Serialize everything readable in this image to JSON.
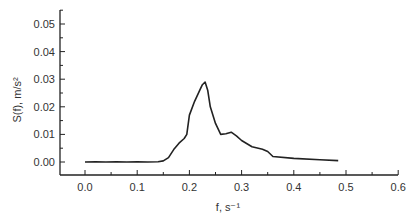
{
  "chart_data": {
    "type": "line",
    "title": "",
    "xlabel": "f, s⁻¹",
    "ylabel": "S(f), m/s²",
    "xlim": [
      -0.05,
      0.6
    ],
    "ylim": [
      -0.005,
      0.055
    ],
    "x_ticks": [
      "0.0",
      "0.1",
      "0.2",
      "0.3",
      "0.4",
      "0.5",
      "0.6"
    ],
    "y_ticks": [
      "0.00",
      "0.01",
      "0.02",
      "0.03",
      "0.04",
      "0.05"
    ],
    "grid": false,
    "legend": null,
    "series": [
      {
        "name": "S(f)",
        "color": "#222222",
        "x": [
          0.0,
          0.02,
          0.04,
          0.06,
          0.08,
          0.1,
          0.12,
          0.14,
          0.15,
          0.16,
          0.17,
          0.18,
          0.19,
          0.195,
          0.2,
          0.21,
          0.22,
          0.225,
          0.23,
          0.235,
          0.24,
          0.25,
          0.26,
          0.27,
          0.28,
          0.29,
          0.3,
          0.32,
          0.34,
          0.35,
          0.36,
          0.4,
          0.45,
          0.485
        ],
        "y": [
          0.0,
          0.0001,
          0.0,
          0.0001,
          0.0,
          0.0001,
          0.0,
          0.0001,
          0.0004,
          0.0016,
          0.0045,
          0.0068,
          0.0085,
          0.01,
          0.017,
          0.022,
          0.026,
          0.028,
          0.029,
          0.026,
          0.02,
          0.014,
          0.01,
          0.0102,
          0.0108,
          0.0095,
          0.0078,
          0.0055,
          0.0046,
          0.0038,
          0.002,
          0.0013,
          0.0008,
          0.0005
        ]
      }
    ]
  }
}
